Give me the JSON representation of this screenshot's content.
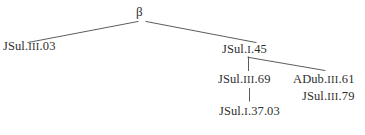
{
  "diagram": {
    "type": "stemma-codicum",
    "root": {
      "id": "beta",
      "label": "β"
    },
    "nodes": [
      {
        "id": "jsul-iii-03",
        "prefix": "JSul.",
        "numeral": "III",
        "number": ".03",
        "full_label": "JSul.III.03"
      },
      {
        "id": "jsul-i-45",
        "prefix": "JSul.",
        "numeral": "I",
        "number": ".45",
        "full_label": "JSul.I.45"
      },
      {
        "id": "jsul-iii-69",
        "prefix": "JSul.",
        "numeral": "III",
        "number": ".69",
        "full_label": "JSul.III.69"
      },
      {
        "id": "adub-iii-61",
        "prefix": "ADub.",
        "numeral": "III",
        "number": ".61",
        "full_label": "ADub.III.61"
      },
      {
        "id": "jsul-iii-79",
        "prefix": "JSul.",
        "numeral": "III",
        "number": ".79",
        "full_label": "JSul.III.79"
      },
      {
        "id": "jsul-i-37-03",
        "prefix": "JSul.",
        "numeral": "I",
        "number": ".37.03",
        "full_label": "JSul.I.37.03"
      }
    ],
    "edges": [
      {
        "from": "beta",
        "to": "jsul-iii-03",
        "style": "diagonal"
      },
      {
        "from": "beta",
        "to": "jsul-i-45",
        "style": "diagonal"
      },
      {
        "from": "jsul-i-45",
        "to": "jsul-iii-69",
        "style": "vertical"
      },
      {
        "from": "jsul-i-45",
        "to": "adub-iii-61",
        "style": "diagonal"
      },
      {
        "from": "jsul-iii-69",
        "to": "jsul-i-37-03",
        "style": "vertical"
      }
    ],
    "colors": {
      "background": "#ffffff",
      "text": "#2e2e2e",
      "line": "#4a4a4a"
    }
  }
}
